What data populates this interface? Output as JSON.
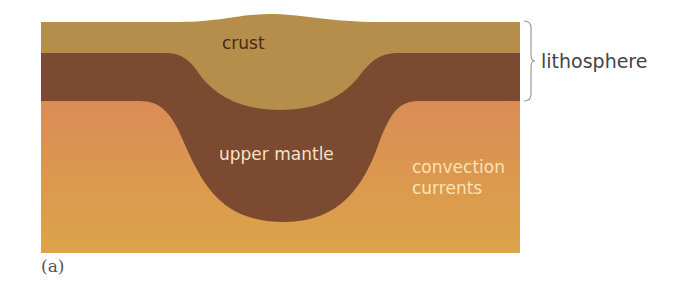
{
  "figure": {
    "panel_label": "(a)",
    "labels": {
      "crust": "crust",
      "upper_mantle": "upper mantle",
      "convection_line1": "convection",
      "convection_line2": "currents",
      "lithosphere": "lithosphere"
    },
    "colors": {
      "crust": "#b48e48",
      "lithospheric_mantle": "#7a4a30",
      "asthenosphere_top": "#d9895a",
      "asthenosphere_bottom": "#dba04a",
      "brace": "#999999"
    }
  }
}
